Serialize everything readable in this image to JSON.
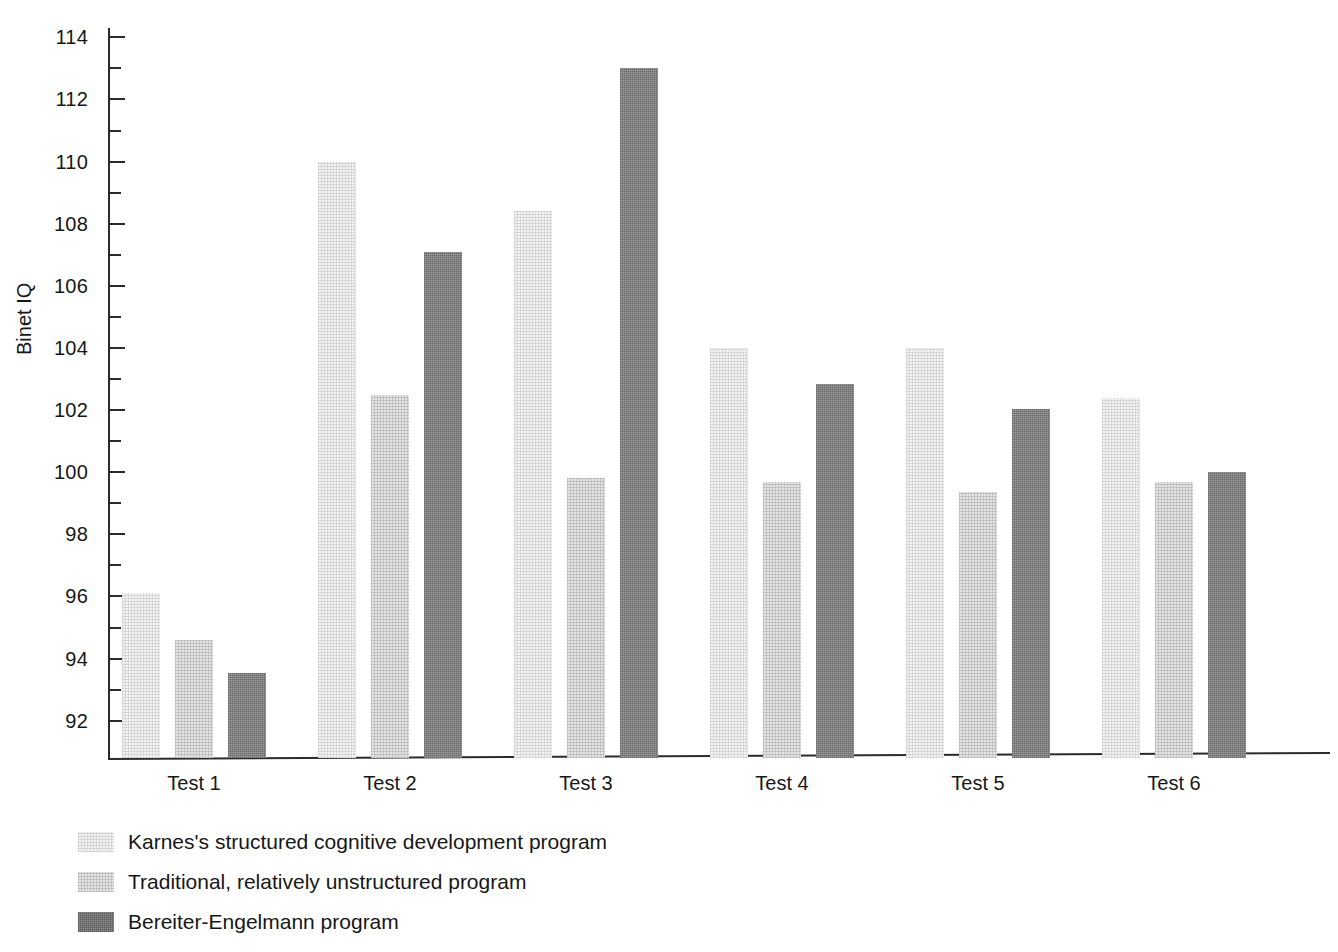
{
  "chart_data": {
    "type": "bar",
    "title": "",
    "xlabel": "",
    "ylabel": "Binet IQ",
    "categories": [
      "Test 1",
      "Test 2",
      "Test 3",
      "Test 4",
      "Test 5",
      "Test 6"
    ],
    "ylim": [
      90.8,
      114.3
    ],
    "y_ticks_major": [
      92,
      94,
      96,
      98,
      100,
      102,
      104,
      106,
      108,
      110,
      112,
      114
    ],
    "y_tick_step_minor": 1,
    "grid": false,
    "legend_position": "below-left",
    "series": [
      {
        "name": "Karnes's structured cognitive development program",
        "color": "#f1f1f1",
        "values": [
          96.1,
          110.0,
          108.4,
          104.0,
          104.0,
          102.4
        ]
      },
      {
        "name": "Traditional, relatively unstructured program",
        "color": "#e3e3e3",
        "values": [
          94.6,
          102.5,
          99.8,
          99.7,
          99.35,
          99.7
        ]
      },
      {
        "name": "Bereiter-Engelmann program",
        "color": "#8e8e8e",
        "values": [
          93.55,
          107.1,
          113.0,
          102.85,
          102.05,
          100.0
        ]
      }
    ]
  },
  "axis": {
    "y_title": "Binet IQ",
    "y_tick_labels": [
      "114",
      "112",
      "110",
      "108",
      "106",
      "104",
      "102",
      "100",
      "98",
      "96",
      "94",
      "92"
    ]
  },
  "legend": {
    "items": [
      {
        "label": "Karnes's structured cognitive development program",
        "swatch": "legend-swatch-light"
      },
      {
        "label": "Traditional, relatively unstructured program",
        "swatch": "legend-swatch-medium-light"
      },
      {
        "label": "Bereiter-Engelmann program",
        "swatch": "legend-swatch-dark"
      }
    ]
  }
}
